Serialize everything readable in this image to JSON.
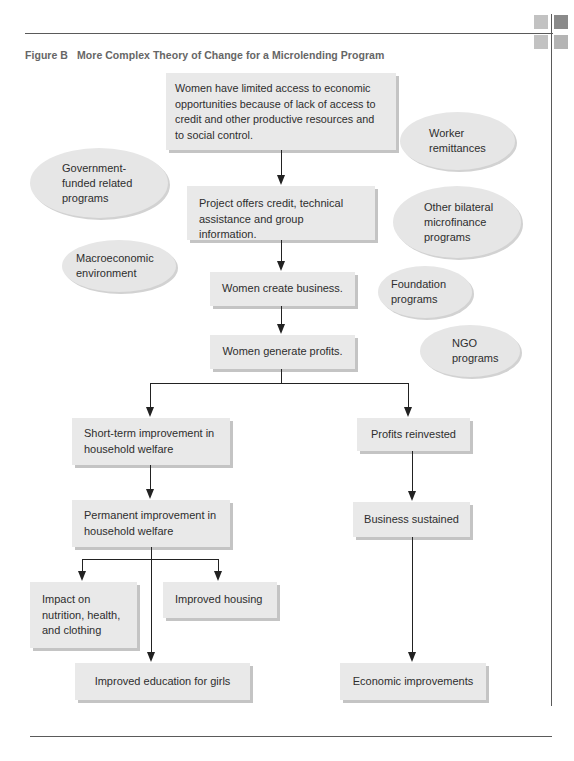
{
  "header": {
    "figure_label": "Figure B",
    "title": "More Complex Theory of Change for a Microlending Program"
  },
  "decor": {
    "squares": [
      "#c2c2c2",
      "#8a8a8a",
      "#c2c2c2",
      "#b4b4b4"
    ],
    "rule_color": "#5a5a5a"
  },
  "nodes": {
    "root": "Women have limited access to economic\nopportunities because of lack of access to\ncredit and other productive resources and\nto social control.",
    "project": "Project offers credit, technical\nassistance and group information.",
    "create_business": "Women create business.",
    "generate_profits": "Women generate profits.",
    "short_term": "Short-term improvement in\nhousehold welfare",
    "permanent": "Permanent improvement in\nhousehold welfare",
    "impact_nutrition": "Impact on\nnutrition, health,\nand clothing",
    "improved_housing": "Improved housing",
    "improved_education": "Improved education for girls",
    "profits_reinvested": "Profits reinvested",
    "business_sustained": "Business sustained",
    "economic_improvements": "Economic improvements"
  },
  "external_factors": {
    "worker_remittances": "Worker\nremittances",
    "government_programs": "Government-\nfunded related\nprograms",
    "other_bilateral": "Other bilateral\nmicrofinance\nprograms",
    "macroeconomic": "Macroeconomic\nenvironment",
    "foundation": "Foundation\nprograms",
    "ngo": "NGO\nprograms"
  }
}
